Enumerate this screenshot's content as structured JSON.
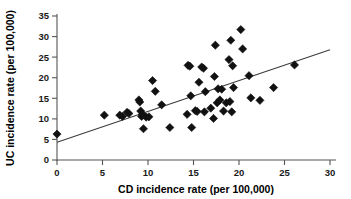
{
  "chart_data": {
    "type": "scatter",
    "title": "",
    "xlabel": "CD incidence rate (per 100,000)",
    "ylabel": "UC incidence rate (per 100,000)",
    "xlim": [
      0,
      30
    ],
    "ylim": [
      0,
      35
    ],
    "xticks": [
      0,
      5,
      10,
      15,
      20,
      25,
      30
    ],
    "yticks": [
      0,
      5,
      10,
      15,
      20,
      25,
      30,
      35
    ],
    "grid": false,
    "legend": "none",
    "marker_style": "filled-diamond",
    "marker_color": "#111111",
    "points": [
      [
        0.0,
        6.3
      ],
      [
        5.2,
        10.9
      ],
      [
        6.9,
        10.9
      ],
      [
        7.2,
        10.6
      ],
      [
        7.7,
        11.6
      ],
      [
        7.9,
        11.3
      ],
      [
        9.0,
        14.6
      ],
      [
        9.1,
        14.1
      ],
      [
        9.2,
        11.9
      ],
      [
        9.3,
        10.6
      ],
      [
        9.4,
        11.1
      ],
      [
        9.5,
        7.6
      ],
      [
        9.8,
        10.4
      ],
      [
        10.1,
        10.5
      ],
      [
        10.5,
        19.3
      ],
      [
        10.8,
        16.7
      ],
      [
        11.5,
        13.4
      ],
      [
        12.4,
        7.9
      ],
      [
        14.3,
        11.1
      ],
      [
        14.4,
        23.0
      ],
      [
        14.6,
        22.8
      ],
      [
        14.7,
        15.6
      ],
      [
        14.8,
        7.9
      ],
      [
        15.2,
        12.0
      ],
      [
        15.4,
        11.8
      ],
      [
        15.6,
        18.9
      ],
      [
        15.9,
        22.6
      ],
      [
        16.1,
        22.3
      ],
      [
        16.2,
        11.7
      ],
      [
        16.3,
        16.6
      ],
      [
        16.9,
        12.6
      ],
      [
        17.2,
        10.1
      ],
      [
        17.3,
        20.3
      ],
      [
        17.4,
        27.9
      ],
      [
        17.6,
        13.9
      ],
      [
        17.7,
        17.3
      ],
      [
        17.9,
        14.6
      ],
      [
        18.1,
        17.2
      ],
      [
        18.3,
        11.9
      ],
      [
        18.6,
        13.9
      ],
      [
        18.9,
        24.4
      ],
      [
        19.0,
        14.2
      ],
      [
        19.1,
        29.1
      ],
      [
        19.2,
        11.7
      ],
      [
        19.3,
        22.9
      ],
      [
        19.4,
        17.6
      ],
      [
        20.2,
        31.7
      ],
      [
        20.4,
        27.0
      ],
      [
        21.1,
        20.5
      ],
      [
        21.3,
        15.1
      ],
      [
        22.3,
        14.5
      ],
      [
        23.8,
        17.6
      ],
      [
        26.1,
        23.1
      ]
    ],
    "fit_line": {
      "label": "regression-line",
      "x_start": 0.0,
      "y_start": 4.3,
      "x_end": 30.0,
      "y_end": 26.8
    }
  }
}
